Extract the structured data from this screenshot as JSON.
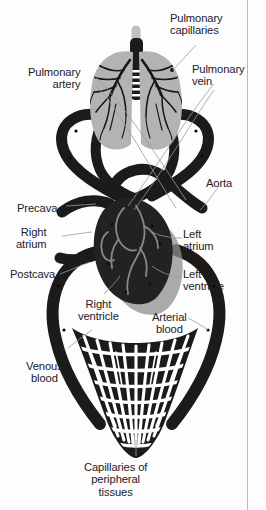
{
  "figure": {
    "type": "anatomical-diagram",
    "colors": {
      "vessel_dark": "#1d1b1a",
      "lung_gray": "#b3b3b3",
      "heart_dark": "#242121",
      "heart_shadow": "#8f8d8d",
      "chamber_outline": "#8a8888",
      "leader_line": "#9a9a9a",
      "background": "#fdfdfd",
      "text": "#23201f",
      "border_rule": "#b9b9b9"
    },
    "structures": [
      {
        "name": "lungs",
        "fill": "lung_gray",
        "description": "paired lungs with dark bronchial trees"
      },
      {
        "name": "trachea",
        "fill": "vessel_dark",
        "description": "central airway with vertebral markings"
      },
      {
        "name": "heart",
        "fill": "heart_dark",
        "description": "four-chambered heart, cut-away"
      },
      {
        "name": "pulmonary-circuit",
        "fill": "vessel_dark",
        "description": "upper vessel loop to lungs"
      },
      {
        "name": "systemic-circuit",
        "fill": "vessel_dark",
        "description": "large lower loop to body"
      },
      {
        "name": "capillary-bed",
        "fill": "vessel_dark",
        "description": "dense mesh of peripheral capillaries"
      }
    ]
  },
  "labels": [
    {
      "id": "pulmonary-capillaries",
      "lines": [
        "Pulmonary",
        "capillaries"
      ],
      "side": "right",
      "x": 170,
      "y": 12
    },
    {
      "id": "pulmonary-artery",
      "lines": [
        "Pulmonary",
        "artery"
      ],
      "side": "left",
      "x": 28,
      "y": 66
    },
    {
      "id": "pulmonary-vein",
      "lines": [
        "Pulmonary",
        "vein"
      ],
      "side": "right",
      "x": 192,
      "y": 63
    },
    {
      "id": "aorta",
      "lines": [
        "Aorta"
      ],
      "side": "right",
      "x": 206,
      "y": 177
    },
    {
      "id": "precava",
      "lines": [
        "Precava"
      ],
      "side": "left",
      "x": 17,
      "y": 202
    },
    {
      "id": "right-atrium",
      "lines": [
        "Right",
        "atrium"
      ],
      "side": "left",
      "x": 16,
      "y": 226
    },
    {
      "id": "postcava",
      "lines": [
        "Postcava"
      ],
      "side": "left",
      "x": 10,
      "y": 268
    },
    {
      "id": "left-atrium",
      "lines": [
        "Left",
        "atrium"
      ],
      "side": "right",
      "x": 183,
      "y": 228
    },
    {
      "id": "left-ventricle",
      "lines": [
        "Left",
        "ventricle"
      ],
      "side": "right",
      "x": 183,
      "y": 268
    },
    {
      "id": "right-ventricle",
      "lines": [
        "Right",
        "ventricle"
      ],
      "side": "center",
      "x": 78,
      "y": 298
    },
    {
      "id": "arterial-blood",
      "lines": [
        "Arterial",
        "blood"
      ],
      "side": "center",
      "x": 152,
      "y": 311
    },
    {
      "id": "venous-blood",
      "lines": [
        "Venous",
        "blood"
      ],
      "side": "center",
      "x": 26,
      "y": 360
    },
    {
      "id": "capillaries-peripheral",
      "lines": [
        "Capillaries of",
        "peripheral",
        "tissues"
      ],
      "side": "center",
      "x": 84,
      "y": 461
    }
  ]
}
